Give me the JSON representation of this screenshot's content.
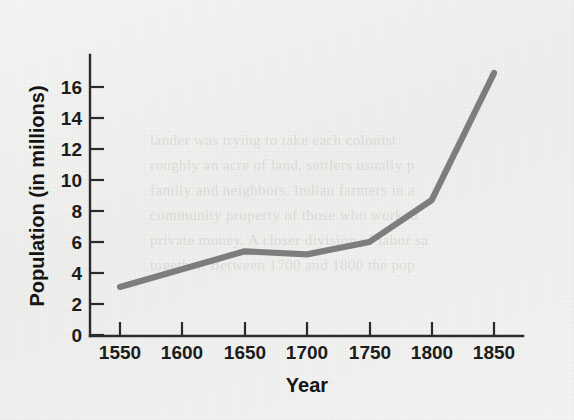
{
  "chart_data": {
    "type": "line",
    "title": "",
    "xlabel": "Year",
    "ylabel": "Population (in millions)",
    "x": [
      1550,
      1650,
      1700,
      1750,
      1800,
      1850
    ],
    "values": [
      3.1,
      5.4,
      5.2,
      6.0,
      8.7,
      16.9
    ],
    "series": [
      {
        "name": "Population",
        "values": [
          3.1,
          5.4,
          5.2,
          6.0,
          8.7,
          16.9
        ]
      }
    ],
    "xlim": [
      1530,
      1870
    ],
    "ylim": [
      0,
      17.5
    ],
    "xticks": [
      1550,
      1600,
      1650,
      1700,
      1750,
      1800,
      1850
    ],
    "xtick_labels": [
      "1550",
      "1600",
      "1650",
      "1700",
      "1750",
      "1800",
      "1850"
    ],
    "yticks": [
      0,
      2,
      4,
      6,
      8,
      10,
      12,
      14,
      16
    ],
    "ytick_labels": [
      "0",
      "2",
      "4",
      "6",
      "8",
      "10",
      "12",
      "14",
      "16"
    ],
    "grid": false,
    "legend": false,
    "line_color": "#7d7d7d",
    "axis_color": "#2b2b2b",
    "background_color": "#f2f2f0"
  },
  "figure": {
    "background_note": "",
    "bleed_text": "lander was trying to take each colonist\nroughly an acre of land, settlers usually p\nfamily and neighbors. Indian farmers in a\ncommunity property of those who worked\nprivate money. A closer division of labor sa\ntogether. Between 1700 and 1800 the pop\n\nrapidly expanded as an ever increasing num"
  }
}
